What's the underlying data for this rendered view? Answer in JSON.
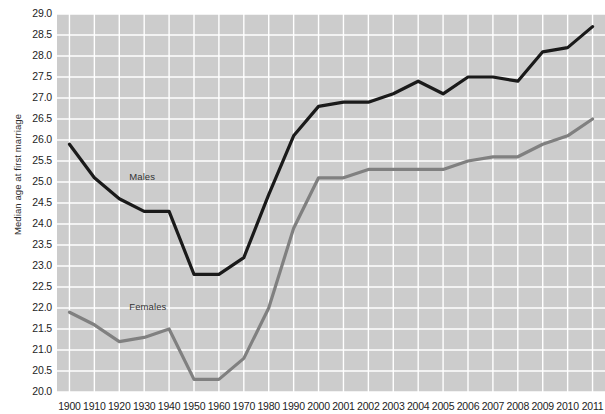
{
  "chart_data": {
    "type": "line",
    "title": "",
    "xlabel": "",
    "ylabel": "Median age at first marriage",
    "ylim": [
      20.0,
      29.0
    ],
    "ytick_step": 0.5,
    "grid": true,
    "legend": "inline-series-labels",
    "plot_background": "#cccccc",
    "gridline_color": "#ffffff",
    "page_background": "#ffffff",
    "categories": [
      "1900",
      "1910",
      "1920",
      "1930",
      "1940",
      "1950",
      "1960",
      "1970",
      "1980",
      "1990",
      "2000",
      "2001",
      "2002",
      "2003",
      "2004",
      "2005",
      "2006",
      "2007",
      "2008",
      "2009",
      "2010",
      "2011"
    ],
    "yticks": [
      "20.0",
      "20.5",
      "21.0",
      "21.5",
      "22.0",
      "22.5",
      "23.0",
      "23.5",
      "24.0",
      "24.5",
      "25.0",
      "25.5",
      "26.0",
      "26.5",
      "27.0",
      "27.5",
      "28.0",
      "28.5",
      "29.0"
    ],
    "series": [
      {
        "name": "Males",
        "color": "#1a1a1a",
        "label_x": "1920",
        "label_y": 25.1,
        "values": [
          25.9,
          25.1,
          24.6,
          24.3,
          24.3,
          22.8,
          22.8,
          23.2,
          24.7,
          26.1,
          26.8,
          26.9,
          26.9,
          27.1,
          27.4,
          27.1,
          27.5,
          27.5,
          27.4,
          28.1,
          28.2,
          28.7
        ]
      },
      {
        "name": "Females",
        "color": "#808080",
        "label_x": "1920",
        "label_y": 22.0,
        "values": [
          21.9,
          21.6,
          21.2,
          21.3,
          21.5,
          20.3,
          20.3,
          20.8,
          22.0,
          23.9,
          25.1,
          25.1,
          25.3,
          25.3,
          25.3,
          25.3,
          25.5,
          25.6,
          25.6,
          25.9,
          26.1,
          26.5
        ]
      }
    ]
  }
}
